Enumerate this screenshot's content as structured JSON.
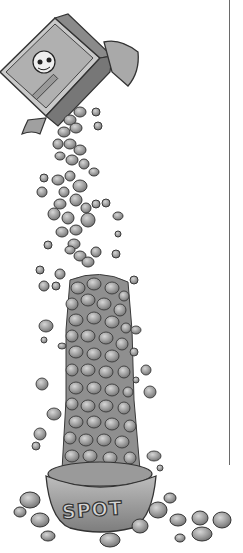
{
  "illustration": {
    "subject": "Box of dog food pouring a tall column of kibble into a dog bowl",
    "bowl_label": "SPOT",
    "colors": {
      "background": "#ffffff",
      "ink": "#333333",
      "kibble": "#9a9a9a",
      "kibble_highlight": "#c8c8c8",
      "box_face": "#bdbdbd",
      "rule_line": "#6a6a6a"
    }
  }
}
